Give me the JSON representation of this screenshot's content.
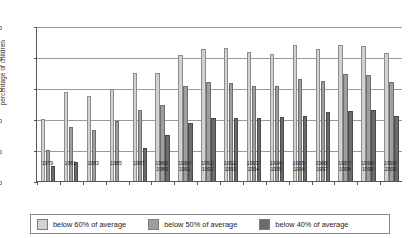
{
  "chart_data": {
    "type": "bar",
    "title": "",
    "xlabel": "",
    "ylabel": "percentage of children",
    "ylim": [
      0,
      50
    ],
    "yticks": [
      0,
      10,
      20,
      30,
      40,
      50
    ],
    "grid": true,
    "legend_position": "bottom",
    "categories": [
      "1979",
      "1981",
      "1983",
      "1985",
      "1987",
      "1988/\n1989",
      "1990/\n1991",
      "1991/\n1992",
      "1992/\n1993",
      "1993/\n1994",
      "1994/\n1995",
      "1995/\n1996",
      "1996/\n1997",
      "1997/\n1998",
      "1998/\n1999",
      "1999/\n2000"
    ],
    "category_lines": [
      [
        "1979",
        ""
      ],
      [
        "1981",
        ""
      ],
      [
        "1983",
        ""
      ],
      [
        "1985",
        ""
      ],
      [
        "1987",
        ""
      ],
      [
        "1988/",
        "1989"
      ],
      [
        "1990/",
        "1991"
      ],
      [
        "1991/",
        "1992"
      ],
      [
        "1992/",
        "1993"
      ],
      [
        "1993/",
        "1994"
      ],
      [
        "1994/",
        "1995"
      ],
      [
        "1995/",
        "1996"
      ],
      [
        "1996/",
        "1997"
      ],
      [
        "1997/",
        "1998"
      ],
      [
        "1998/",
        "1999"
      ],
      [
        "1999/",
        "2000"
      ]
    ],
    "series": [
      {
        "name": "below 60% of average",
        "key": "s60",
        "color": "#d2d2d2",
        "values": [
          20,
          28.8,
          27.5,
          29.8,
          34.8,
          34.8,
          40.5,
          42.5,
          42.8,
          41.5,
          41,
          43.8,
          42.5,
          43.8,
          43.5,
          41.3
        ]
      },
      {
        "name": "below 50% of average",
        "key": "s50",
        "color": "#9e9e9e",
        "values": [
          10,
          17.5,
          16.5,
          19.5,
          23,
          24.5,
          30.8,
          32,
          31.5,
          30.5,
          30.5,
          33,
          32.3,
          34.5,
          34.3,
          31.8
        ]
      },
      {
        "name": "below 40% of average",
        "key": "s40",
        "color": "#6b6b6b",
        "values": [
          4.8,
          6,
          null,
          null,
          10.5,
          14.8,
          18.8,
          20.3,
          20.3,
          20.3,
          20.8,
          21,
          22.3,
          22.5,
          22.8,
          21
        ]
      }
    ]
  },
  "legend": {
    "items": [
      {
        "label": "below 60% of average",
        "key": "s60"
      },
      {
        "label": "below 50% of average",
        "key": "s50"
      },
      {
        "label": "below 40% of average",
        "key": "s40"
      }
    ]
  }
}
